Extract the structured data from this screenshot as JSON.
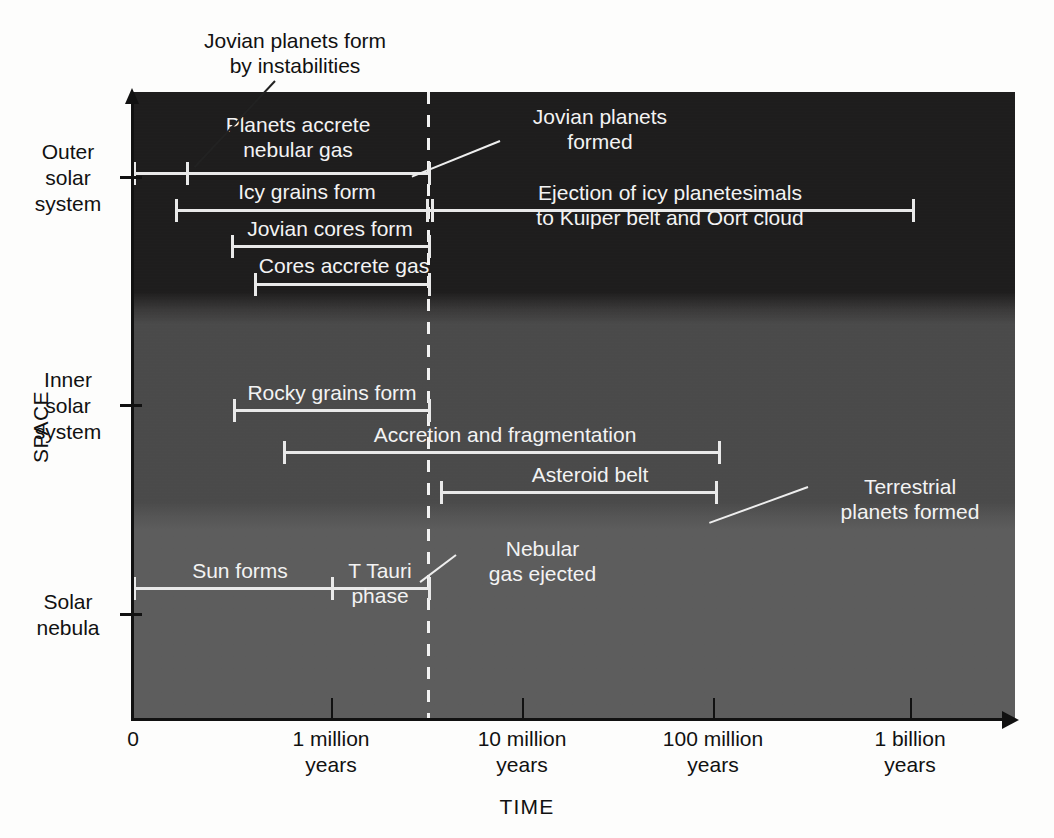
{
  "figure": {
    "x_axis_title": "TIME",
    "y_axis_title": "SPACE"
  },
  "chart_data": {
    "type": "timeline",
    "xlabel": "TIME",
    "ylabel": "SPACE",
    "x_scale": "logarithmic",
    "x_ticks": [
      {
        "label": "0",
        "value": 0,
        "x": 133
      },
      {
        "label": "1 million\nyears",
        "value": 1000000,
        "x": 331
      },
      {
        "label": "10 million\nyears",
        "value": 10000000,
        "x": 522
      },
      {
        "label": "100 million\nyears",
        "value": 100000000,
        "x": 713
      },
      {
        "label": "1 billion\nyears",
        "value": 1000000000,
        "x": 910
      }
    ],
    "y_categories": [
      {
        "label": "Outer\nsolar\nsystem",
        "tick_y": 176
      },
      {
        "label": "Inner\nsolar\nsystem",
        "tick_y": 404
      },
      {
        "label": "Solar\nnebula",
        "tick_y": 613
      }
    ],
    "regions": [
      {
        "name": "outer-solar-system",
        "color": "#1d1c1c"
      },
      {
        "name": "inner-solar-system",
        "color": "#4a4a4a"
      },
      {
        "name": "solar-nebula",
        "color": "#5d5d5d"
      }
    ],
    "marker": {
      "name": "nebular-gas-ejection-marker",
      "style": "dashed-vertical",
      "color": "#f2f2f2",
      "x": 428
    },
    "events": [
      {
        "label": "Planets accrete\nnebular gas",
        "region": "outer-solar-system",
        "y": 172,
        "x_start": 133,
        "x_end": 428,
        "caps": [
          133,
          186,
          428
        ],
        "label_x": 183,
        "label_y": 112,
        "label_w": 230
      },
      {
        "label": "Icy grains form",
        "region": "outer-solar-system",
        "y": 209,
        "x_start": 175,
        "x_end": 912,
        "caps": [
          175,
          426,
          431,
          912
        ],
        "label_x": 187,
        "label_y": 179,
        "label_w": 240
      },
      {
        "label": "Ejection of icy planetesimals\nto Kuiper belt and Oort cloud",
        "region": "outer-solar-system",
        "y": 209,
        "x_start": 428,
        "x_end": 912,
        "caps": [],
        "label_x": 500,
        "label_y": 180,
        "label_w": 340
      },
      {
        "label": "Jovian cores form",
        "region": "outer-solar-system",
        "y": 245,
        "x_start": 231,
        "x_end": 428,
        "caps": [
          231,
          428
        ],
        "label_x": 230,
        "label_y": 216,
        "label_w": 200
      },
      {
        "label": "Cores accrete gas",
        "region": "outer-solar-system",
        "y": 283,
        "x_start": 254,
        "x_end": 428,
        "caps": [
          254,
          428
        ],
        "label_x": 249,
        "label_y": 253,
        "label_w": 190
      },
      {
        "label": "Rocky grains form",
        "region": "inner-solar-system",
        "y": 409,
        "x_start": 233,
        "x_end": 428,
        "caps": [
          233,
          428
        ],
        "label_x": 232,
        "label_y": 380,
        "label_w": 200
      },
      {
        "label": "Accretion and fragmentation",
        "region": "inner-solar-system",
        "y": 451,
        "x_start": 283,
        "x_end": 718,
        "caps": [
          283,
          718
        ],
        "label_x": 355,
        "label_y": 422,
        "label_w": 300
      },
      {
        "label": "Asteroid belt",
        "region": "inner-solar-system",
        "y": 491,
        "x_start": 440,
        "x_end": 715,
        "caps": [
          440,
          715
        ],
        "label_x": 510,
        "label_y": 462,
        "label_w": 160
      },
      {
        "label": "Sun forms",
        "region": "solar-nebula",
        "y": 587,
        "x_start": 133,
        "x_end": 428,
        "caps": [
          133,
          331,
          428
        ],
        "label_x": 165,
        "label_y": 558,
        "label_w": 150
      },
      {
        "label": "T Tauri\nphase",
        "region": "solar-nebula",
        "y": 587,
        "x_start": 331,
        "x_end": 428,
        "caps": [],
        "label_x": 335,
        "label_y": 558,
        "label_w": 90
      }
    ],
    "callouts": [
      {
        "name": "jovian-planets-form-by-instabilities",
        "text": "Jovian planets form\nby instabilities",
        "color": "dark",
        "text_x": 150,
        "text_y": 28,
        "text_w": 290,
        "leader_x": 275,
        "leader_y": 80,
        "leader_len": 118,
        "leader_angle": 133
      },
      {
        "name": "jovian-planets-formed",
        "text": "Jovian planets\nformed",
        "color": "light",
        "text_x": 500,
        "text_y": 104,
        "text_w": 200,
        "leader_x": 500,
        "leader_y": 140,
        "leader_len": 95,
        "leader_angle": 158
      },
      {
        "name": "terrestrial-planets-formed",
        "text": "Terrestrial\nplanets formed",
        "color": "light",
        "text_x": 810,
        "text_y": 474,
        "text_w": 200,
        "leader_x": 808,
        "leader_y": 486,
        "leader_len": 105,
        "leader_angle": 160
      },
      {
        "name": "nebular-gas-ejected",
        "text": "Nebular\ngas ejected",
        "color": "light",
        "text_x": 455,
        "text_y": 536,
        "text_w": 175,
        "leader_x": 456,
        "leader_y": 554,
        "leader_len": 45,
        "leader_angle": 143
      }
    ]
  }
}
